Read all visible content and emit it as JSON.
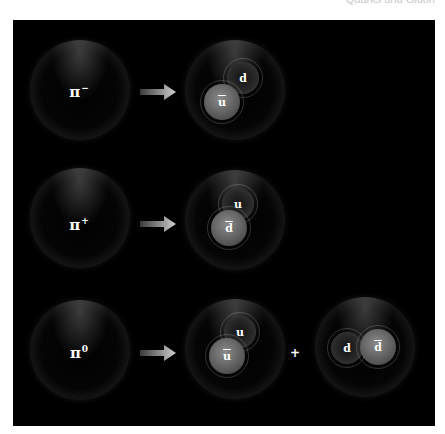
{
  "header": {
    "partial_text": "Quarks und Gluon"
  },
  "rows": [
    {
      "pion_label": "π",
      "pion_charge": "−",
      "quarks": [
        {
          "label": "d",
          "antiquark": false,
          "shade": "dark"
        },
        {
          "label": "u",
          "antiquark": true,
          "shade": "light"
        }
      ]
    },
    {
      "pion_label": "π",
      "pion_charge": "+",
      "quarks": [
        {
          "label": "u",
          "antiquark": false,
          "shade": "dark"
        },
        {
          "label": "d",
          "antiquark": true,
          "shade": "light"
        }
      ]
    },
    {
      "pion_label": "π",
      "pion_charge": "0",
      "quarks": [
        {
          "label": "u",
          "antiquark": false,
          "shade": "dark"
        },
        {
          "label": "u",
          "antiquark": true,
          "shade": "light"
        }
      ],
      "plus_sign": "+",
      "alt_quarks": [
        {
          "label": "d",
          "antiquark": false,
          "shade": "dark"
        },
        {
          "label": "d",
          "antiquark": true,
          "shade": "light"
        }
      ]
    }
  ],
  "colors": {
    "background": "#000000",
    "page": "#ffffff",
    "arrow": "#bdbdbd"
  }
}
